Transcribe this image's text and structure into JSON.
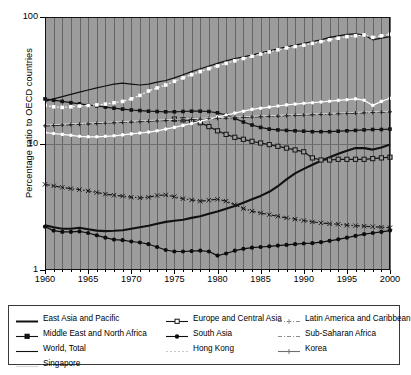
{
  "chart_data": {
    "type": "line",
    "title": "",
    "xlabel": "",
    "ylabel": "Percentage ratio to OECD countries",
    "yscale": "log",
    "ylim": [
      1,
      100
    ],
    "ytick_labels": [
      "1",
      "10",
      "100"
    ],
    "ytick_values": [
      1,
      10,
      100
    ],
    "xlim": [
      1960,
      2000
    ],
    "xtick_labels": [
      "1960",
      "1965",
      "1970",
      "1975",
      "1980",
      "1985",
      "1990",
      "1995",
      "2000"
    ],
    "xtick_values": [
      1960,
      1965,
      1970,
      1975,
      1980,
      1985,
      1990,
      1995,
      2000
    ],
    "grid": "vertical gridlines each year, horizontal gridlines at decades",
    "legend_position": "below plot, 3 columns",
    "plot_background": "#9c9c9c",
    "x": [
      1960,
      1961,
      1962,
      1963,
      1964,
      1965,
      1966,
      1967,
      1968,
      1969,
      1970,
      1971,
      1972,
      1973,
      1974,
      1975,
      1976,
      1977,
      1978,
      1979,
      1980,
      1981,
      1982,
      1983,
      1984,
      1985,
      1986,
      1987,
      1988,
      1989,
      1990,
      1991,
      1992,
      1993,
      1994,
      1995,
      1996,
      1997,
      1998,
      1999,
      2000
    ],
    "series": [
      {
        "name": "East Asia and Pacific",
        "color": "#111111",
        "style": "solid-thick",
        "marker": "none",
        "values": [
          2.25,
          2.18,
          2.12,
          2.12,
          2.16,
          2.1,
          2.05,
          2.03,
          2.04,
          2.06,
          2.12,
          2.18,
          2.24,
          2.32,
          2.4,
          2.45,
          2.5,
          2.58,
          2.66,
          2.78,
          2.9,
          3.05,
          3.2,
          3.4,
          3.62,
          3.85,
          4.15,
          4.6,
          5.2,
          5.8,
          6.3,
          6.8,
          7.3,
          7.8,
          8.3,
          8.75,
          9.2,
          9.2,
          8.95,
          9.3,
          9.8
        ]
      },
      {
        "name": "Europe and Central Asia",
        "color": "#161616",
        "style": "solid",
        "marker": "square-open",
        "values": [
          null,
          null,
          null,
          null,
          null,
          null,
          null,
          null,
          null,
          null,
          null,
          null,
          null,
          null,
          null,
          15.6,
          15.4,
          15.2,
          14.6,
          13.6,
          12.6,
          11.8,
          11.2,
          10.8,
          10.4,
          10.1,
          9.8,
          9.5,
          9.2,
          8.9,
          8.6,
          7.7,
          7.4,
          7.4,
          7.5,
          7.5,
          7.5,
          7.5,
          7.6,
          7.7,
          7.8
        ]
      },
      {
        "name": "Latin America and Caribbean",
        "color": "#1a1a1a",
        "style": "dash-dot",
        "marker": "cross-small",
        "values": [
          4.75,
          4.62,
          4.5,
          4.4,
          4.32,
          4.22,
          4.1,
          3.98,
          3.9,
          3.84,
          3.76,
          3.72,
          3.76,
          3.88,
          3.92,
          3.8,
          3.66,
          3.58,
          3.5,
          3.56,
          3.62,
          3.5,
          3.28,
          3.06,
          2.92,
          2.82,
          2.74,
          2.66,
          2.58,
          2.52,
          2.46,
          2.4,
          2.36,
          2.32,
          2.3,
          2.26,
          2.24,
          2.22,
          2.2,
          2.18,
          2.16
        ]
      },
      {
        "name": "Middle East and North Africa",
        "color": "#131313",
        "style": "solid",
        "marker": "square",
        "values": [
          22.5,
          22.0,
          21.5,
          21.0,
          20.6,
          20.2,
          19.8,
          19.4,
          19.0,
          18.7,
          18.4,
          18.2,
          18.0,
          17.9,
          17.8,
          17.8,
          17.9,
          18.0,
          18.0,
          17.9,
          17.5,
          16.8,
          15.8,
          14.8,
          14.0,
          13.4,
          13.0,
          12.8,
          12.7,
          12.6,
          12.5,
          12.4,
          12.4,
          12.4,
          12.5,
          12.6,
          12.7,
          12.8,
          12.9,
          12.9,
          13.0
        ]
      },
      {
        "name": "South Asia",
        "color": "#0d0d0d",
        "style": "solid",
        "marker": "circle",
        "values": [
          2.2,
          2.05,
          2.0,
          2.0,
          2.02,
          1.96,
          1.88,
          1.8,
          1.74,
          1.72,
          1.68,
          1.65,
          1.6,
          1.52,
          1.44,
          1.4,
          1.4,
          1.41,
          1.42,
          1.4,
          1.3,
          1.35,
          1.42,
          1.47,
          1.5,
          1.52,
          1.54,
          1.56,
          1.58,
          1.6,
          1.62,
          1.63,
          1.66,
          1.7,
          1.75,
          1.8,
          1.86,
          1.92,
          1.96,
          2.0,
          2.05
        ]
      },
      {
        "name": "Sub-Saharan Africa",
        "color": "#202020",
        "style": "dash-dot",
        "marker": "none",
        "values": [
          13.8,
          13.9,
          14.0,
          14.1,
          14.2,
          14.3,
          14.4,
          14.5,
          14.6,
          14.7,
          14.8,
          14.9,
          15.0,
          15.1,
          15.2,
          15.3,
          15.4,
          15.5,
          15.6,
          15.7,
          15.8,
          15.9,
          16.0,
          16.1,
          16.2,
          16.3,
          16.4,
          16.5,
          16.6,
          16.7,
          16.8,
          16.9,
          17.0,
          17.1,
          17.2,
          17.3,
          17.4,
          17.5,
          17.6,
          17.7,
          17.8
        ]
      },
      {
        "name": "World, Total",
        "color": "#111111",
        "style": "solid",
        "marker": "none",
        "values": [
          21.5,
          22.5,
          23.5,
          24.5,
          25.5,
          26.5,
          27.5,
          28.5,
          29.5,
          30.0,
          29.5,
          29.0,
          29.5,
          30.5,
          31.5,
          33.0,
          35.0,
          37.0,
          39.0,
          41.0,
          43.0,
          45.0,
          47.0,
          48.5,
          50.0,
          52.0,
          54.0,
          56.0,
          58.0,
          60.0,
          62.0,
          64.0,
          66.0,
          69.0,
          71.0,
          73.0,
          73.5,
          72.0,
          66.0,
          68.0,
          70.0
        ]
      },
      {
        "name": "Hong Kong",
        "color": "#f2f2f2",
        "style": "dotted",
        "marker": "square-white",
        "values": [
          20.0,
          19.5,
          19.3,
          19.5,
          19.8,
          20.0,
          20.2,
          20.5,
          21.0,
          21.5,
          22.5,
          24.0,
          26.0,
          27.5,
          29.0,
          31.0,
          33.0,
          35.0,
          37.0,
          39.0,
          41.0,
          43.0,
          45.0,
          47.0,
          49.0,
          51.0,
          53.0,
          55.0,
          57.0,
          58.5,
          60.0,
          62.0,
          64.0,
          66.0,
          68.0,
          70.0,
          71.0,
          72.0,
          69.0,
          71.0,
          73.0
        ]
      },
      {
        "name": "Korea",
        "color": "#ffffff",
        "style": "solid",
        "marker": "circle-white",
        "values": [
          12.2,
          12.0,
          11.8,
          11.6,
          11.4,
          11.3,
          11.3,
          11.4,
          11.5,
          11.7,
          11.9,
          12.1,
          12.3,
          12.6,
          13.0,
          13.4,
          13.9,
          14.4,
          15.0,
          15.6,
          16.2,
          16.8,
          17.4,
          18.0,
          18.6,
          19.0,
          19.4,
          19.8,
          20.2,
          20.5,
          20.8,
          21.0,
          21.3,
          21.6,
          21.9,
          22.2,
          22.5,
          22.0,
          20.0,
          21.5,
          22.8
        ]
      },
      {
        "name": "Singapore",
        "color": "#d6d6d6",
        "style": "solid-faint",
        "marker": "none",
        "values": [
          14.0,
          14.1,
          14.2,
          14.3,
          14.4,
          14.5,
          14.6,
          14.7,
          14.8,
          14.9,
          15.0,
          15.1,
          15.2,
          15.3,
          15.4,
          15.5,
          15.6,
          15.7,
          15.8,
          15.9,
          16.0,
          16.1,
          16.2,
          16.3,
          16.4,
          16.5,
          16.6,
          16.7,
          16.8,
          16.9,
          17.0,
          17.1,
          17.2,
          17.3,
          17.4,
          17.5,
          17.6,
          17.7,
          17.8,
          17.9,
          18.0
        ]
      }
    ]
  },
  "legend": {
    "columns": [
      [
        {
          "label": "East Asia and Pacific",
          "symbol": "line-solid-thick",
          "color": "#111111"
        },
        {
          "label": "Middle East and North Africa",
          "symbol": "line-square",
          "color": "#131313"
        },
        {
          "label": "World, Total",
          "symbol": "line-solid",
          "color": "#111111"
        },
        {
          "label": "Singapore",
          "symbol": "line-faint",
          "color": "#d6d6d6"
        }
      ],
      [
        {
          "label": "Europe and Central Asia",
          "symbol": "line-square-open",
          "color": "#161616"
        },
        {
          "label": "South Asia",
          "symbol": "line-circle",
          "color": "#0d0d0d"
        },
        {
          "label": "Hong Kong",
          "symbol": "line-dotted",
          "color": "#c9c9c9"
        }
      ],
      [
        {
          "label": "Latin America and Caribbean",
          "symbol": "line-dashdot-cross",
          "color": "#8d8d8d"
        },
        {
          "label": "Sub-Saharan Africa",
          "symbol": "line-dashdot",
          "color": "#8d8d8d"
        },
        {
          "label": "Korea",
          "symbol": "line-cross",
          "color": "#6f6f6f"
        }
      ]
    ]
  }
}
